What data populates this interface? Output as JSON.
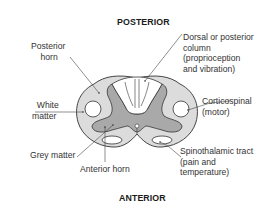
{
  "diagram": {
    "title_top": "POSTERIOR",
    "title_bottom": "ANTERIOR",
    "colors": {
      "white_matter": "#dcdcdc",
      "grey_matter": "#a9a9a9",
      "dorsal_column": "#ffffff",
      "outline": "#333333",
      "text": "#333333"
    },
    "labels": {
      "posterior_horn": "Posterior\n    horn",
      "dorsal_column": "Dorsal or posterior\ncolumn\n(proprioception\nand vibration)",
      "white_matter": "  White\nmatter",
      "corticospinal": "Corticospinal\n(motor)",
      "grey_matter": "Grey matter",
      "spinothalamic": "Spinothalamic tract\n(pain and\ntemperature)",
      "anterior_horn": "Anterior horn"
    }
  }
}
